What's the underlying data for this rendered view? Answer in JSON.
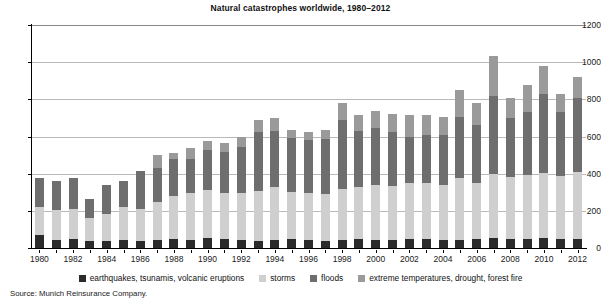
{
  "chart_data": {
    "type": "bar",
    "stacked": true,
    "title": "Natural catastrophes worldwide, 1980–2012",
    "xlabel": "",
    "ylabel": "",
    "ylim": [
      0,
      1200
    ],
    "yticks": [
      0,
      200,
      400,
      600,
      800,
      1000,
      1200
    ],
    "ytick_labels": [
      "0",
      "200",
      "400",
      "600",
      "800",
      "1000",
      "1200"
    ],
    "grid": true,
    "legend_position": "bottom",
    "source": "Source: Munich Reinsurance Company.",
    "categories": [
      "1980",
      "1981",
      "1982",
      "1983",
      "1984",
      "1985",
      "1986",
      "1987",
      "1988",
      "1989",
      "1990",
      "1991",
      "1992",
      "1993",
      "1994",
      "1995",
      "1996",
      "1997",
      "1998",
      "1999",
      "2000",
      "2001",
      "2002",
      "2003",
      "2004",
      "2005",
      "2006",
      "2007",
      "2008",
      "2009",
      "2010",
      "2011",
      "2012"
    ],
    "xtick_labels": [
      "1980",
      "1982",
      "1984",
      "1986",
      "1988",
      "1990",
      "1992",
      "1994",
      "1996",
      "1998",
      "2000",
      "2002",
      "2004",
      "2006",
      "2008",
      "2010",
      "2012"
    ],
    "series": [
      {
        "name": "earthquakes, tsunamis, volcanic eruptions",
        "color": "#2b2b2b",
        "values": [
          70,
          45,
          50,
          40,
          40,
          45,
          40,
          45,
          50,
          45,
          55,
          50,
          45,
          40,
          45,
          50,
          45,
          40,
          45,
          50,
          45,
          45,
          50,
          50,
          45,
          45,
          50,
          55,
          50,
          50,
          55,
          50,
          50
        ]
      },
      {
        "name": "storms",
        "color": "#cfcfcf",
        "values": [
          150,
          160,
          160,
          120,
          145,
          175,
          170,
          205,
          230,
          250,
          255,
          245,
          250,
          265,
          285,
          250,
          250,
          250,
          270,
          280,
          295,
          290,
          300,
          300,
          295,
          330,
          300,
          345,
          330,
          345,
          350,
          335,
          360
        ]
      },
      {
        "name": "floods",
        "color": "#6e6e6e",
        "values": [
          155,
          155,
          165,
          105,
          155,
          140,
          205,
          180,
          200,
          185,
          220,
          220,
          250,
          320,
          300,
          290,
          285,
          295,
          375,
          300,
          305,
          290,
          250,
          260,
          270,
          330,
          310,
          420,
          320,
          335,
          425,
          345,
          395
        ]
      },
      {
        "name": "extreme temperatures, drought, forest fire",
        "color": "#9a9a9a",
        "values": [
          0,
          0,
          0,
          0,
          0,
          0,
          0,
          70,
          30,
          60,
          45,
          50,
          50,
          65,
          70,
          45,
          45,
          50,
          90,
          85,
          95,
          95,
          115,
          105,
          95,
          145,
          120,
          215,
          105,
          145,
          150,
          100,
          115
        ]
      }
    ],
    "totals": [
      375,
      360,
      375,
      265,
      340,
      360,
      415,
      500,
      510,
      540,
      575,
      565,
      595,
      690,
      700,
      635,
      625,
      635,
      780,
      715,
      740,
      720,
      715,
      715,
      705,
      850,
      780,
      1035,
      805,
      875,
      980,
      830,
      920
    ]
  },
  "colors": {
    "grid": "#b9b9b9",
    "axis": "#000000",
    "background": "#ffffff"
  }
}
